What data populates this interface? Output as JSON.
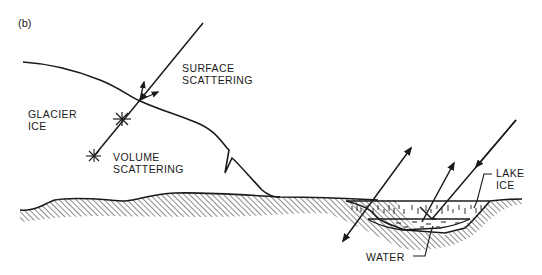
{
  "panel_label": "(b)",
  "labels": {
    "surface_scattering_1": "SURFACE",
    "surface_scattering_2": "SCATTERING",
    "glacier_ice_1": "GLACIER",
    "glacier_ice_2": "ICE",
    "volume_scattering_1": "VOLUME",
    "volume_scattering_2": "SCATTERING",
    "lake_ice_1": "LAKE",
    "lake_ice_2": "ICE",
    "water": "WATER"
  },
  "colors": {
    "ink": "#1a1a1a",
    "background": "#ffffff"
  }
}
